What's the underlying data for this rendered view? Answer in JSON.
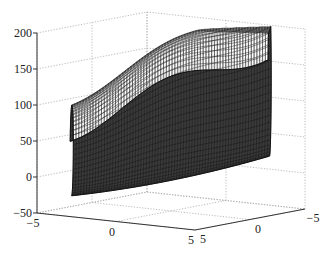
{
  "chart_data": {
    "type": "surface",
    "title": "",
    "xlabel": "",
    "ylabel": "",
    "zlabel": "",
    "x_ticks": [
      -5,
      0,
      5
    ],
    "y_ticks": [
      5,
      0,
      -5
    ],
    "z_ticks": [
      200,
      150,
      100,
      50,
      0,
      -50
    ],
    "xlim": [
      -5,
      5
    ],
    "ylim": [
      -5,
      5
    ],
    "zlim": [
      -50,
      200
    ],
    "grid": true,
    "surface_description": "dense black mesh surface shaped like a curved saddle/tube, lowest near x=0 front (z about -50), rising to about 200 at back-right",
    "mesh_color": "#111111"
  }
}
